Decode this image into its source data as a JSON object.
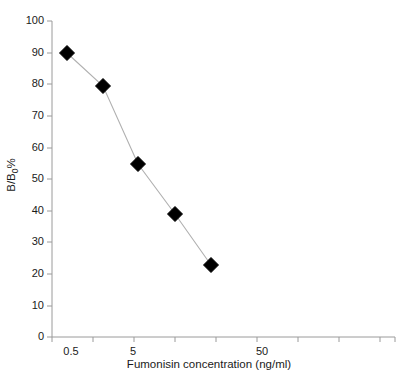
{
  "chart_data": {
    "type": "line",
    "title": "",
    "subtitle": "",
    "xlabel": "Fumonisin concentration (ng/ml)",
    "ylabel_text": "B/B",
    "ylabel_sub": "0",
    "ylabel_suffix": "%",
    "xscale": "log",
    "yscale": "linear",
    "ylim": [
      0,
      100
    ],
    "ytick_labels": [
      "100",
      "90",
      "80",
      "70",
      "60",
      "50",
      "40",
      "30",
      "20",
      "10",
      "0"
    ],
    "ytick_values": [
      100,
      90,
      80,
      70,
      60,
      50,
      40,
      30,
      20,
      10,
      0
    ],
    "xtick_labels": [
      "0.5",
      "5",
      "50"
    ],
    "xtick_values": [
      0.5,
      5,
      50
    ],
    "grid": false,
    "legend": "none",
    "marker": "filled-diamond",
    "marker_color": "#000000",
    "line_color": "#b0b0b0",
    "axis_color": "#9a9a9a",
    "x": [
      0.5,
      1.5,
      4.6,
      11,
      26
    ],
    "values": [
      89,
      79.3,
      54.4,
      39.3,
      22.8
    ],
    "series": [
      {
        "name": "Fumonisin standard curve",
        "points": [
          {
            "x": 0.5,
            "y": 89
          },
          {
            "x": 1.5,
            "y": 79.3
          },
          {
            "x": 4.6,
            "y": 54.4
          },
          {
            "x": 11,
            "y": 39.3
          },
          {
            "x": 26,
            "y": 22.8
          }
        ]
      }
    ]
  },
  "geometry": {
    "plot_left": 52,
    "plot_right": 395,
    "plot_top": 21,
    "plot_bottom": 337,
    "ytick_y": [
      21,
      53,
      84,
      116,
      148,
      179,
      211,
      242,
      274,
      306,
      337
    ],
    "xtick_x": [
      52,
      93,
      134,
      175,
      216,
      257,
      298,
      339,
      380,
      395
    ],
    "xlabel_x": [
      71,
      133,
      262
    ],
    "pixel_points": [
      {
        "px": 67,
        "py": 53
      },
      {
        "px": 103,
        "py": 86
      },
      {
        "px": 138,
        "py": 164
      },
      {
        "px": 175,
        "py": 214
      },
      {
        "px": 211,
        "py": 265
      }
    ]
  }
}
